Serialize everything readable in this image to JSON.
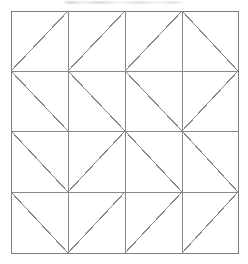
{
  "figure": {
    "kind": "geometric-line-diagram",
    "canvas_width": 248,
    "canvas_height": 264,
    "background_color": "#ffffff"
  },
  "style": {
    "line_color": "#888888",
    "border_color": "#7f7f7f",
    "line_width": 1,
    "diagonal_line_width": 1.1
  },
  "grid": {
    "columns": 4,
    "rows": 4,
    "x_positions": [
      11,
      68,
      125,
      182,
      238
    ],
    "y_positions": [
      11,
      71,
      131,
      192,
      253
    ],
    "left": 11,
    "top": 11,
    "right": 238,
    "bottom": 253,
    "cell_width": 56.75,
    "cell_height": 60.5
  },
  "cells": [
    {
      "row": 0,
      "col": 0,
      "diagonal": "/"
    },
    {
      "row": 0,
      "col": 1,
      "diagonal": "/"
    },
    {
      "row": 0,
      "col": 2,
      "diagonal": "/"
    },
    {
      "row": 0,
      "col": 3,
      "diagonal": "\\"
    },
    {
      "row": 1,
      "col": 0,
      "diagonal": "\\"
    },
    {
      "row": 1,
      "col": 1,
      "diagonal": "\\"
    },
    {
      "row": 1,
      "col": 2,
      "diagonal": "\\"
    },
    {
      "row": 1,
      "col": 3,
      "diagonal": "/"
    },
    {
      "row": 2,
      "col": 0,
      "diagonal": "\\"
    },
    {
      "row": 2,
      "col": 1,
      "diagonal": "/"
    },
    {
      "row": 2,
      "col": 2,
      "diagonal": "\\"
    },
    {
      "row": 2,
      "col": 3,
      "diagonal": "\\"
    },
    {
      "row": 3,
      "col": 0,
      "diagonal": "\\"
    },
    {
      "row": 3,
      "col": 1,
      "diagonal": "/"
    },
    {
      "row": 3,
      "col": 2,
      "diagonal": "/"
    },
    {
      "row": 3,
      "col": 3,
      "diagonal": "/"
    }
  ],
  "diagonal_rows": [
    "/ / / \\",
    "\\ \\ \\ /",
    "\\ / \\ \\",
    "\\ / / /"
  ],
  "center_point": {
    "x": 125,
    "y": 131,
    "converging_lines": 8
  }
}
